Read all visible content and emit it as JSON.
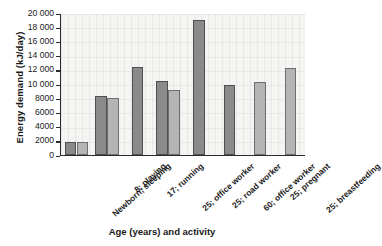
{
  "chart_data": {
    "type": "bar",
    "title": "",
    "xlabel": "Age (years) and activity",
    "ylabel": "Energy demand (kJ/day)",
    "ylim": [
      0,
      20000
    ],
    "ytick_labels": [
      "20 000",
      "18 000",
      "16 000",
      "14 000",
      "12 000",
      "10 000",
      "8000",
      "6000",
      "4000",
      "2000",
      "0"
    ],
    "ytick_values": [
      20000,
      18000,
      16000,
      14000,
      12000,
      10000,
      8000,
      6000,
      4000,
      2000,
      0
    ],
    "grid": "light vertical and horizontal gridlines",
    "legend": "none",
    "categories": [
      "Newborn; sleeping",
      "8; playing",
      "17; running",
      "25; office worker",
      "25; road worker",
      "60; office worker",
      "25; pregnant",
      "25; breastfeeding"
    ],
    "series": [
      {
        "name": "male",
        "color": "#8a8a8a",
        "values": [
          1900,
          8300,
          12450,
          10400,
          19000,
          9800,
          null,
          null
        ]
      },
      {
        "name": "female",
        "color": "#b4b4b4",
        "values": [
          1900,
          8000,
          null,
          9150,
          null,
          null,
          10300,
          12200
        ]
      }
    ]
  },
  "axis": {
    "y_title": "Energy demand (kJ/day)",
    "x_title": "Age (years) and activity"
  }
}
